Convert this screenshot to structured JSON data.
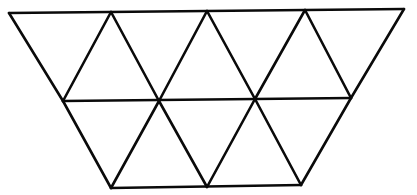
{
  "diagram": {
    "title": "Trapezoid tiled with equilateral triangles",
    "shape": "inverted trapezoid",
    "triangle_count": 9,
    "rows": [
      {
        "name": "top",
        "down_triangles": 4,
        "up_triangles": 3
      },
      {
        "name": "bottom",
        "down_triangles": 2,
        "up_triangles": 0
      }
    ],
    "stroke_color": "#0a0a0a",
    "background_color": "#ffffff",
    "vertices": {
      "top": [
        [
          9,
          13
        ],
        [
          111,
          12
        ],
        [
          207,
          11
        ],
        [
          305,
          10
        ],
        [
          404,
          9
        ]
      ],
      "middle": [
        [
          63,
          101
        ],
        [
          159,
          101
        ],
        [
          255,
          99
        ],
        [
          351,
          98
        ]
      ],
      "bottom": [
        [
          111,
          188
        ],
        [
          207,
          187
        ],
        [
          301,
          185
        ]
      ]
    }
  }
}
